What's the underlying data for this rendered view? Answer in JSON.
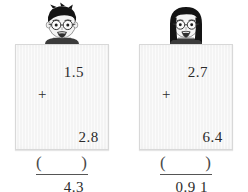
{
  "worksheet": {
    "type": "vertical-addition-check",
    "problems": [
      {
        "child": "boy-with-glasses",
        "addend1": "1.5",
        "addend2": "2.8",
        "operator": "+",
        "result": "4.3",
        "answer_blank_open": "(",
        "answer_blank_close": ")",
        "answer_value": ""
      },
      {
        "child": "girl-with-glasses",
        "addend1": "2.7",
        "addend2": "6.4",
        "operator": "+",
        "result": "0.9 1",
        "answer_blank_open": "(",
        "answer_blank_close": ")",
        "answer_value": ""
      }
    ]
  },
  "colors": {
    "ink": "#2b2b2b",
    "card_face": "#fbfbfb",
    "card_border": "#d8d8d8",
    "hair": "#1a1a1a",
    "skin": "#f2f2f2",
    "rule": "#555555"
  }
}
